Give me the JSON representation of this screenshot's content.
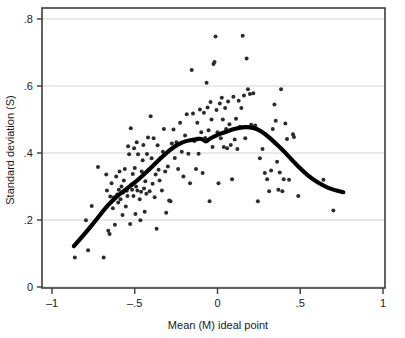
{
  "chart_data": {
    "type": "scatter",
    "title": "",
    "xlabel": "Mean (M) ideal point",
    "ylabel": "Standard deviation (S)",
    "xlim": [
      -1,
      1
    ],
    "ylim": [
      0,
      0.8
    ],
    "xticks": [
      -1,
      -0.5,
      0,
      0.5,
      1
    ],
    "xticklabels": [
      "–1",
      "–.5",
      "0",
      ".5",
      "1"
    ],
    "yticks": [
      0,
      0.2,
      0.4,
      0.6,
      0.8
    ],
    "yticklabels": [
      "0",
      ".2",
      ".4",
      ".6",
      ".8"
    ],
    "grid": "horizontal",
    "legend": "none",
    "point_color": "#2b2b2b",
    "line_color": "#000000",
    "gridline_color": "#e2e2e2",
    "frame_color": "#3c3c3c",
    "series": [
      {
        "name": "legislators",
        "type": "scatter",
        "marker": "filled-circle",
        "points": [
          [
            -0.862,
            0.088
          ],
          [
            -0.795,
            0.199
          ],
          [
            -0.782,
            0.11
          ],
          [
            -0.76,
            0.242
          ],
          [
            -0.722,
            0.358
          ],
          [
            -0.688,
            0.088
          ],
          [
            -0.672,
            0.336
          ],
          [
            -0.668,
            0.288
          ],
          [
            -0.66,
            0.168
          ],
          [
            -0.652,
            0.158
          ],
          [
            -0.648,
            0.27
          ],
          [
            -0.64,
            0.31
          ],
          [
            -0.632,
            0.235
          ],
          [
            -0.626,
            0.268
          ],
          [
            -0.62,
            0.186
          ],
          [
            -0.612,
            0.33
          ],
          [
            -0.606,
            0.276
          ],
          [
            -0.6,
            0.252
          ],
          [
            -0.596,
            0.29
          ],
          [
            -0.592,
            0.345
          ],
          [
            -0.586,
            0.262
          ],
          [
            -0.58,
            0.3
          ],
          [
            -0.574,
            0.215
          ],
          [
            -0.57,
            0.282
          ],
          [
            -0.566,
            0.318
          ],
          [
            -0.56,
            0.352
          ],
          [
            -0.554,
            0.24
          ],
          [
            -0.548,
            0.287
          ],
          [
            -0.544,
            0.272
          ],
          [
            -0.54,
            0.42
          ],
          [
            -0.534,
            0.396
          ],
          [
            -0.528,
            0.188
          ],
          [
            -0.524,
            0.474
          ],
          [
            -0.52,
            0.306
          ],
          [
            -0.516,
            0.29
          ],
          [
            -0.512,
            0.337
          ],
          [
            -0.508,
            0.272
          ],
          [
            -0.504,
            0.414
          ],
          [
            -0.5,
            0.355
          ],
          [
            -0.496,
            0.218
          ],
          [
            -0.492,
            0.3
          ],
          [
            -0.488,
            0.432
          ],
          [
            -0.484,
            0.288
          ],
          [
            -0.48,
            0.396
          ],
          [
            -0.476,
            0.322
          ],
          [
            -0.47,
            0.262
          ],
          [
            -0.466,
            0.199
          ],
          [
            -0.462,
            0.284
          ],
          [
            -0.458,
            0.345
          ],
          [
            -0.452,
            0.378
          ],
          [
            -0.448,
            0.424
          ],
          [
            -0.444,
            0.294
          ],
          [
            -0.44,
            0.225
          ],
          [
            -0.436,
            0.316
          ],
          [
            -0.43,
            0.278
          ],
          [
            -0.426,
            0.397
          ],
          [
            -0.42,
            0.446
          ],
          [
            -0.416,
            0.35
          ],
          [
            -0.41,
            0.286
          ],
          [
            -0.404,
            0.51
          ],
          [
            -0.398,
            0.384
          ],
          [
            -0.392,
            0.308
          ],
          [
            -0.386,
            0.444
          ],
          [
            -0.38,
            0.268
          ],
          [
            -0.374,
            0.336
          ],
          [
            -0.368,
            0.174
          ],
          [
            -0.362,
            0.423
          ],
          [
            -0.356,
            0.35
          ],
          [
            -0.35,
            0.318
          ],
          [
            -0.344,
            0.385
          ],
          [
            -0.336,
            0.288
          ],
          [
            -0.33,
            0.404
          ],
          [
            -0.324,
            0.472
          ],
          [
            -0.316,
            0.345
          ],
          [
            -0.31,
            0.222
          ],
          [
            -0.3,
            0.36
          ],
          [
            -0.292,
            0.258
          ],
          [
            -0.284,
            0.256
          ],
          [
            -0.276,
            0.428
          ],
          [
            -0.266,
            0.47
          ],
          [
            -0.258,
            0.385
          ],
          [
            -0.248,
            0.432
          ],
          [
            -0.238,
            0.352
          ],
          [
            -0.226,
            0.49
          ],
          [
            -0.216,
            0.404
          ],
          [
            -0.206,
            0.33
          ],
          [
            -0.196,
            0.452
          ],
          [
            -0.186,
            0.516
          ],
          [
            -0.176,
            0.398
          ],
          [
            -0.166,
            0.31
          ],
          [
            -0.156,
            0.648
          ],
          [
            -0.148,
            0.518
          ],
          [
            -0.14,
            0.436
          ],
          [
            -0.13,
            0.352
          ],
          [
            -0.122,
            0.49
          ],
          [
            -0.114,
            0.398
          ],
          [
            -0.106,
            0.53
          ],
          [
            -0.098,
            0.462
          ],
          [
            -0.09,
            0.34
          ],
          [
            -0.082,
            0.52
          ],
          [
            -0.074,
            0.445
          ],
          [
            -0.066,
            0.61
          ],
          [
            -0.06,
            0.536
          ],
          [
            -0.054,
            0.468
          ],
          [
            -0.048,
            0.256
          ],
          [
            -0.042,
            0.552
          ],
          [
            -0.036,
            0.5
          ],
          [
            -0.03,
            0.418
          ],
          [
            -0.024,
            0.666
          ],
          [
            -0.018,
            0.672
          ],
          [
            -0.012,
            0.748
          ],
          [
            -0.006,
            0.528
          ],
          [
            0.0,
            0.462
          ],
          [
            0.006,
            0.31
          ],
          [
            0.014,
            0.548
          ],
          [
            0.02,
            0.444
          ],
          [
            0.026,
            0.565
          ],
          [
            0.032,
            0.5
          ],
          [
            0.038,
            0.418
          ],
          [
            0.046,
            0.534
          ],
          [
            0.052,
            0.472
          ],
          [
            0.058,
            0.414
          ],
          [
            0.064,
            0.554
          ],
          [
            0.072,
            0.486
          ],
          [
            0.08,
            0.424
          ],
          [
            0.088,
            0.322
          ],
          [
            0.096,
            0.568
          ],
          [
            0.104,
            0.44
          ],
          [
            0.112,
            0.502
          ],
          [
            0.12,
            0.412
          ],
          [
            0.128,
            0.556
          ],
          [
            0.136,
            0.478
          ],
          [
            0.144,
            0.534
          ],
          [
            0.152,
            0.75
          ],
          [
            0.16,
            0.572
          ],
          [
            0.168,
            0.444
          ],
          [
            0.176,
            0.682
          ],
          [
            0.184,
            0.59
          ],
          [
            0.196,
            0.576
          ],
          [
            0.204,
            0.484
          ],
          [
            0.216,
            0.578
          ],
          [
            0.228,
            0.482
          ],
          [
            0.244,
            0.256
          ],
          [
            0.256,
            0.384
          ],
          [
            0.272,
            0.412
          ],
          [
            0.286,
            0.34
          ],
          [
            0.3,
            0.322
          ],
          [
            0.312,
            0.286
          ],
          [
            0.324,
            0.348
          ],
          [
            0.334,
            0.472
          ],
          [
            0.344,
            0.545
          ],
          [
            0.352,
            0.496
          ],
          [
            0.36,
            0.374
          ],
          [
            0.368,
            0.29
          ],
          [
            0.376,
            0.342
          ],
          [
            0.384,
            0.59
          ],
          [
            0.392,
            0.286
          ],
          [
            0.4,
            0.322
          ],
          [
            0.41,
            0.488
          ],
          [
            0.42,
            0.442
          ],
          [
            0.432,
            0.32
          ],
          [
            0.456,
            0.456
          ],
          [
            0.462,
            0.448
          ],
          [
            0.488,
            0.272
          ],
          [
            0.64,
            0.32
          ],
          [
            0.7,
            0.228
          ]
        ]
      },
      {
        "name": "lowess-fit",
        "type": "line",
        "points": [
          [
            -0.868,
            0.122
          ],
          [
            -0.8,
            0.16
          ],
          [
            -0.74,
            0.196
          ],
          [
            -0.69,
            0.228
          ],
          [
            -0.64,
            0.256
          ],
          [
            -0.59,
            0.278
          ],
          [
            -0.54,
            0.296
          ],
          [
            -0.49,
            0.316
          ],
          [
            -0.44,
            0.338
          ],
          [
            -0.39,
            0.362
          ],
          [
            -0.34,
            0.386
          ],
          [
            -0.29,
            0.408
          ],
          [
            -0.24,
            0.426
          ],
          [
            -0.19,
            0.436
          ],
          [
            -0.14,
            0.44
          ],
          [
            -0.095,
            0.444
          ],
          [
            -0.07,
            0.432
          ],
          [
            -0.05,
            0.442
          ],
          [
            -0.01,
            0.452
          ],
          [
            0.04,
            0.462
          ],
          [
            0.09,
            0.47
          ],
          [
            0.14,
            0.476
          ],
          [
            0.19,
            0.478
          ],
          [
            0.24,
            0.472
          ],
          [
            0.29,
            0.456
          ],
          [
            0.34,
            0.434
          ],
          [
            0.4,
            0.406
          ],
          [
            0.46,
            0.374
          ],
          [
            0.52,
            0.344
          ],
          [
            0.58,
            0.32
          ],
          [
            0.64,
            0.302
          ],
          [
            0.7,
            0.29
          ],
          [
            0.76,
            0.283
          ]
        ]
      }
    ]
  }
}
